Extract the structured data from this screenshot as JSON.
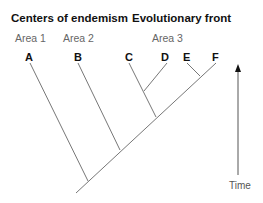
{
  "headers": {
    "left": "Centers of endemism",
    "right": "Evolutionary front"
  },
  "areas": [
    {
      "label": "Area 1"
    },
    {
      "label": "Area 2"
    },
    {
      "label": "Area 3"
    }
  ],
  "taxa": [
    {
      "label": "A"
    },
    {
      "label": "B"
    },
    {
      "label": "C"
    },
    {
      "label": "D"
    },
    {
      "label": "E"
    },
    {
      "label": "F"
    }
  ],
  "axis": {
    "label": "Time",
    "direction": "up"
  },
  "colors": {
    "line": "#777777",
    "text": "#111111",
    "area_text": "#666666"
  }
}
